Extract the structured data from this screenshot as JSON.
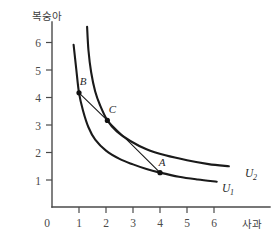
{
  "chart_data": {
    "type": "line",
    "title": "",
    "xlabel": "사과",
    "ylabel": "복숭아",
    "xlim": [
      0,
      7
    ],
    "ylim": [
      0,
      7
    ],
    "grid": false,
    "legend_position": "inline-right",
    "x_ticks": [
      "0",
      "1",
      "2",
      "3",
      "4",
      "5",
      "6"
    ],
    "y_ticks": [
      "1",
      "2",
      "3",
      "4",
      "5",
      "6"
    ],
    "series": [
      {
        "name": "U_1",
        "label": "U",
        "subscript": "1",
        "description": "lower indifference curve",
        "points": [
          [
            0.8,
            5.9
          ],
          [
            0.9,
            5.0
          ],
          [
            1.0,
            4.15
          ],
          [
            1.15,
            3.5
          ],
          [
            1.35,
            2.9
          ],
          [
            1.6,
            2.45
          ],
          [
            2.0,
            2.05
          ],
          [
            2.5,
            1.75
          ],
          [
            3.0,
            1.55
          ],
          [
            3.5,
            1.38
          ],
          [
            4.0,
            1.25
          ],
          [
            4.7,
            1.1
          ],
          [
            5.4,
            1.0
          ],
          [
            6.1,
            0.92
          ]
        ]
      },
      {
        "name": "U_2",
        "label": "U",
        "subscript": "2",
        "description": "upper indifference curve",
        "points": [
          [
            1.3,
            6.55
          ],
          [
            1.35,
            5.7
          ],
          [
            1.45,
            4.9
          ],
          [
            1.6,
            4.2
          ],
          [
            1.78,
            3.7
          ],
          [
            2.05,
            3.15
          ],
          [
            2.4,
            2.75
          ],
          [
            2.9,
            2.4
          ],
          [
            3.5,
            2.1
          ],
          [
            4.2,
            1.88
          ],
          [
            5.0,
            1.7
          ],
          [
            5.8,
            1.56
          ],
          [
            6.55,
            1.48
          ]
        ]
      },
      {
        "name": "budget-line",
        "label": "",
        "subscript": "",
        "description": "line segment from B through C to A",
        "points": [
          [
            1.0,
            4.15
          ],
          [
            2.05,
            3.15
          ],
          [
            4.0,
            1.25
          ]
        ]
      }
    ],
    "annotations": [
      {
        "label": "A",
        "x": 4.0,
        "y": 1.25,
        "label_dx": 2,
        "label_dy": -7
      },
      {
        "label": "B",
        "x": 1.0,
        "y": 4.15,
        "label_dx": 4,
        "label_dy": -8
      },
      {
        "label": "C",
        "x": 2.05,
        "y": 3.15,
        "label_dx": 5,
        "label_dy": -7
      }
    ]
  }
}
